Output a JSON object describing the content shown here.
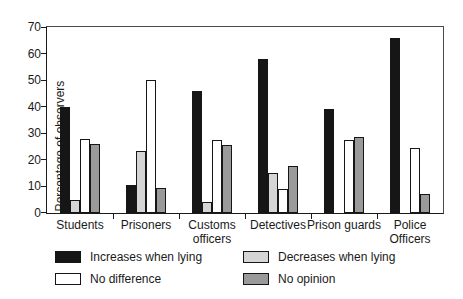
{
  "chart_data": {
    "type": "bar",
    "categories": [
      "Students",
      "Prisoners",
      "Customs officers",
      "Detectives",
      "Prison guards",
      "Police Officers"
    ],
    "xtick_labels": [
      "Students",
      "Prisoners",
      "Customs\nofficers",
      "Detectives",
      "Prison guards",
      "Police\nOfficers"
    ],
    "series": [
      {
        "name": "Increases when lying",
        "color": "#161616",
        "values": [
          40,
          10.5,
          46,
          58,
          39,
          66
        ]
      },
      {
        "name": "Decreases when lying",
        "color": "#d5d5d5",
        "values": [
          5,
          23.5,
          4,
          15,
          0,
          0
        ]
      },
      {
        "name": "No difference",
        "color": "#ffffff",
        "values": [
          28,
          50,
          27.5,
          9,
          27.5,
          24.5
        ]
      },
      {
        "name": "No opinion",
        "color": "#9a9a9a",
        "values": [
          26,
          9.5,
          25.5,
          17.5,
          28.5,
          7
        ]
      }
    ],
    "ylabel": "Percentage of observers",
    "xlabel": "",
    "ylim": [
      0,
      70
    ],
    "yticks": [
      0,
      10,
      20,
      30,
      40,
      50,
      60,
      70
    ],
    "grid": false,
    "legend_position": "bottom",
    "bar_outline_color": "#161616",
    "axis_color": "#1a1a1a"
  },
  "legend": {
    "items": [
      {
        "label": "Increases when lying",
        "color": "#161616"
      },
      {
        "label": "Decreases when lying",
        "color": "#d5d5d5"
      },
      {
        "label": "No difference",
        "color": "#ffffff"
      },
      {
        "label": "No opinion",
        "color": "#9a9a9a"
      }
    ]
  }
}
